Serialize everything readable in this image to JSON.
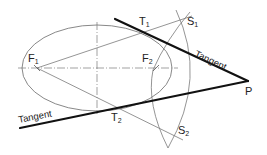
{
  "diagram": {
    "title": "",
    "colors": {
      "thin_line": "#7a7a7a",
      "tangent_line": "#111111",
      "label": "#222222",
      "background": "#ffffff"
    },
    "points": {
      "F1": {
        "label": "F",
        "sub": "1"
      },
      "F2": {
        "label": "F",
        "sub": "2"
      },
      "T1": {
        "label": "T",
        "sub": "1"
      },
      "T2": {
        "label": "T",
        "sub": "2"
      },
      "S1": {
        "label": "S",
        "sub": "1"
      },
      "S2": {
        "label": "S",
        "sub": "2"
      },
      "P": {
        "label": "P"
      }
    },
    "tangent_upper_label": "Tangent",
    "tangent_lower_label": "Tangent"
  }
}
